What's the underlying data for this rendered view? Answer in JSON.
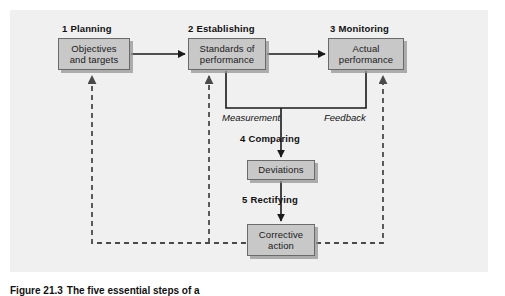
{
  "figure": {
    "background_color": "#ffffff",
    "panel_color": "#f0f0f0",
    "box_fill_color": "#c8c8c8",
    "box_border_color": "#6a6a6a",
    "line_color": "#1a1a1a",
    "caption_number": "Figure 21.3",
    "caption_text": "The five essential steps of a",
    "caption_full": "Figure 21.3  The five essential steps of a"
  },
  "stages": [
    {
      "number": "1",
      "name": "Planning"
    },
    {
      "number": "2",
      "name": "Establishing"
    },
    {
      "number": "3",
      "name": "Monitoring"
    },
    {
      "number": "4",
      "name": "Comparing"
    },
    {
      "number": "5",
      "name": "Rectifying"
    }
  ],
  "nodes": [
    {
      "id": "objectives",
      "label": "Objectives\nand targets",
      "stage": "1"
    },
    {
      "id": "standards",
      "label": "Standards of\nperformance",
      "stage": "2"
    },
    {
      "id": "actual",
      "label": "Actual\nperformance",
      "stage": "3"
    },
    {
      "id": "deviations",
      "label": "Deviations",
      "stage": "4"
    },
    {
      "id": "corrective",
      "label": "Corrective\naction",
      "stage": "5"
    }
  ],
  "annotations": {
    "measurement": "Measurement",
    "feedback": "Feedback"
  },
  "connectors": [
    {
      "from": "objectives",
      "to": "standards",
      "style": "solid",
      "direction": "right"
    },
    {
      "from": "standards",
      "to": "actual",
      "style": "solid",
      "direction": "right"
    },
    {
      "from": "standards",
      "to": "deviations",
      "style": "solid",
      "direction": "down",
      "label": "Measurement"
    },
    {
      "from": "actual",
      "to": "deviations",
      "style": "solid",
      "direction": "down",
      "label": "Feedback"
    },
    {
      "from": "deviations",
      "to": "corrective",
      "style": "solid",
      "direction": "down"
    },
    {
      "from": "corrective",
      "to": "objectives",
      "style": "dashed",
      "direction": "up"
    },
    {
      "from": "corrective",
      "to": "standards",
      "style": "dashed",
      "direction": "up"
    },
    {
      "from": "corrective",
      "to": "actual",
      "style": "dashed",
      "direction": "up"
    }
  ]
}
